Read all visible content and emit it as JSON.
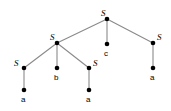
{
  "figure": {
    "name": "parse-tree",
    "background_color": "#ffffff",
    "width": 171,
    "height": 111,
    "edge_color": "#8a8a8a",
    "node_color": "#000000",
    "node_radius": 2.3,
    "edge_width": 1.1
  },
  "tree": {
    "nodes": [
      {
        "id": "root-s",
        "label": "S",
        "kind": "nonterminal",
        "x": 107,
        "y": 19,
        "label_x": 101,
        "label_y": 9,
        "label_anchor": "above-left"
      },
      {
        "id": "left-s",
        "label": "S",
        "kind": "nonterminal",
        "x": 57,
        "y": 43,
        "label_x": 50,
        "label_y": 33,
        "label_anchor": "above-left"
      },
      {
        "id": "mid-c",
        "label": "c",
        "kind": "terminal",
        "x": 107,
        "y": 44,
        "label_x": 104,
        "label_y": 50,
        "label_anchor": "below"
      },
      {
        "id": "right-s",
        "label": "S",
        "kind": "nonterminal",
        "x": 153,
        "y": 43,
        "label_x": 157,
        "label_y": 33,
        "label_anchor": "above-right"
      },
      {
        "id": "left-left-s",
        "label": "S",
        "kind": "nonterminal",
        "x": 24,
        "y": 68,
        "label_x": 14,
        "label_y": 59,
        "label_anchor": "left"
      },
      {
        "id": "left-mid-b",
        "label": "b",
        "kind": "terminal",
        "x": 57,
        "y": 68,
        "label_x": 54,
        "label_y": 74,
        "label_anchor": "below"
      },
      {
        "id": "left-right-s",
        "label": "S",
        "kind": "nonterminal",
        "x": 89,
        "y": 68,
        "label_x": 93,
        "label_y": 59,
        "label_anchor": "right"
      },
      {
        "id": "leaf-a-1",
        "label": "a",
        "kind": "terminal",
        "x": 24,
        "y": 90,
        "label_x": 21,
        "label_y": 96,
        "label_anchor": "below"
      },
      {
        "id": "leaf-a-2",
        "label": "a",
        "kind": "terminal",
        "x": 89,
        "y": 90,
        "label_x": 86,
        "label_y": 96,
        "label_anchor": "below"
      },
      {
        "id": "leaf-a-3",
        "label": "a",
        "kind": "terminal",
        "x": 153,
        "y": 68,
        "label_x": 150,
        "label_y": 74,
        "label_anchor": "below"
      }
    ],
    "edges": [
      {
        "id": "edge-root-left",
        "from": "root-s",
        "to": "left-s",
        "x1": 107,
        "y1": 19,
        "x2": 57,
        "y2": 43
      },
      {
        "id": "edge-root-mid",
        "from": "root-s",
        "to": "mid-c",
        "x1": 107,
        "y1": 19,
        "x2": 107,
        "y2": 44
      },
      {
        "id": "edge-root-right",
        "from": "root-s",
        "to": "right-s",
        "x1": 107,
        "y1": 19,
        "x2": 153,
        "y2": 43
      },
      {
        "id": "edge-left-a",
        "from": "left-s",
        "to": "left-left-s",
        "x1": 57,
        "y1": 43,
        "x2": 24,
        "y2": 68
      },
      {
        "id": "edge-left-b",
        "from": "left-s",
        "to": "left-mid-b",
        "x1": 57,
        "y1": 43,
        "x2": 57,
        "y2": 68
      },
      {
        "id": "edge-left-c",
        "from": "left-s",
        "to": "left-right-s",
        "x1": 57,
        "y1": 43,
        "x2": 89,
        "y2": 68
      },
      {
        "id": "edge-ll-leaf",
        "from": "left-left-s",
        "to": "leaf-a-1",
        "x1": 24,
        "y1": 68,
        "x2": 24,
        "y2": 90
      },
      {
        "id": "edge-lr-leaf",
        "from": "left-right-s",
        "to": "leaf-a-2",
        "x1": 89,
        "y1": 68,
        "x2": 89,
        "y2": 90
      },
      {
        "id": "edge-right-leaf",
        "from": "right-s",
        "to": "leaf-a-3",
        "x1": 153,
        "y1": 43,
        "x2": 153,
        "y2": 68
      }
    ],
    "yield": [
      "a",
      "b",
      "a",
      "c",
      "a"
    ]
  }
}
